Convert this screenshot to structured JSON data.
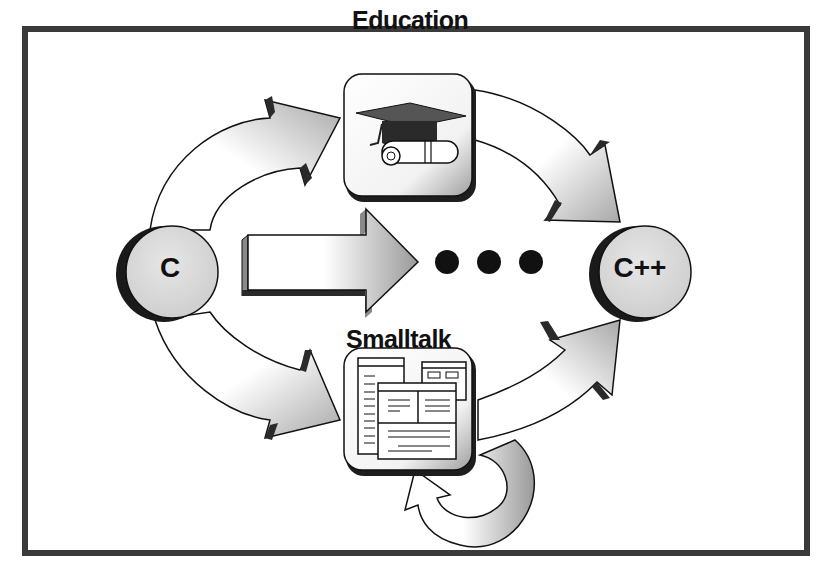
{
  "diagram": {
    "nodes": {
      "source": {
        "label": "C"
      },
      "target": {
        "label": "C++"
      },
      "education": {
        "label": "Education",
        "icon": "graduation-cap-diploma-icon"
      },
      "smalltalk": {
        "label": "Smalltalk",
        "icon": "windows-browser-icon"
      }
    },
    "edges": [
      {
        "from": "C",
        "to": "Education",
        "style": "curved-arrow"
      },
      {
        "from": "Education",
        "to": "C++",
        "style": "curved-arrow"
      },
      {
        "from": "C",
        "to": "Smalltalk",
        "style": "curved-arrow"
      },
      {
        "from": "Smalltalk",
        "to": "C++",
        "style": "curved-arrow"
      },
      {
        "from": "Smalltalk",
        "to": "Smalltalk",
        "style": "loop-arrow"
      },
      {
        "from": "C",
        "to": "C++",
        "style": "straight-arrow-with-ellipsis"
      }
    ],
    "ellipsis": "• • •",
    "colors": {
      "frame": "#3a3a3a",
      "node_fill": "#dcdcdc",
      "arrow_dark": "#9a9a9a",
      "arrow_shadow": "#2a2a2a",
      "dots": "#111111"
    }
  }
}
